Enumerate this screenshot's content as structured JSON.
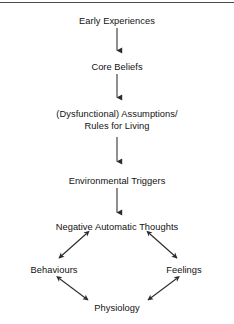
{
  "diagram": {
    "line_color": "#2b2b2b",
    "text_color": "#121212",
    "background_color": "#ffffff",
    "rule_color": "#4a4a4a",
    "nodes": {
      "early_experiences": "Early Experiences",
      "core_beliefs": "Core Beliefs",
      "assumptions_line1": "(Dysfunctional) Assumptions/",
      "assumptions_line2": "Rules for Living",
      "environmental_triggers": "Environmental Triggers",
      "negative_automatic_thoughts": "Negative Automatic Thoughts",
      "behaviours": "Behaviours",
      "feelings": "Feelings",
      "physiology": "Physiology"
    },
    "connectors": [
      {
        "name": "arrow-early-to-core",
        "type": "single-headed",
        "direction": "down",
        "from": "early_experiences",
        "to": "core_beliefs"
      },
      {
        "name": "arrow-core-to-assumptions",
        "type": "single-headed",
        "direction": "down",
        "from": "core_beliefs",
        "to": "assumptions"
      },
      {
        "name": "arrow-assumptions-to-triggers",
        "type": "single-headed",
        "direction": "down",
        "from": "assumptions",
        "to": "environmental_triggers"
      },
      {
        "name": "arrow-triggers-to-thoughts",
        "type": "single-headed",
        "direction": "down",
        "from": "environmental_triggers",
        "to": "negative_automatic_thoughts"
      },
      {
        "name": "arrow-thoughts-behaviours",
        "type": "double-headed",
        "direction": "diagonal-down-left",
        "from": "negative_automatic_thoughts",
        "to": "behaviours"
      },
      {
        "name": "arrow-thoughts-feelings",
        "type": "double-headed",
        "direction": "diagonal-down-right",
        "from": "negative_automatic_thoughts",
        "to": "feelings"
      },
      {
        "name": "arrow-behaviours-physiology",
        "type": "double-headed",
        "direction": "diagonal-down-right",
        "from": "behaviours",
        "to": "physiology"
      },
      {
        "name": "arrow-feelings-physiology",
        "type": "double-headed",
        "direction": "diagonal-down-left",
        "from": "feelings",
        "to": "physiology"
      }
    ]
  }
}
